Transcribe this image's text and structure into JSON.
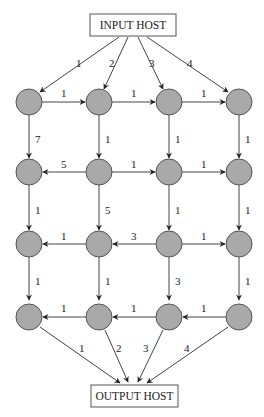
{
  "diagram": {
    "type": "directed weighted grid network",
    "input_host": {
      "label": "INPUT HOST"
    },
    "output_host": {
      "label": "OUTPUT HOST"
    },
    "grid": {
      "rows": 4,
      "cols": 4
    },
    "node_color": "#a9a9a9",
    "edges": {
      "input": [
        {
          "to": "r1c1",
          "weight": "1"
        },
        {
          "to": "r1c2",
          "weight": "2"
        },
        {
          "to": "r1c3",
          "weight": "3"
        },
        {
          "to": "r1c4",
          "weight": "4"
        }
      ],
      "row1": [
        {
          "from": "r1c1",
          "to": "r1c2",
          "weight": "1"
        },
        {
          "from": "r1c2",
          "to": "r1c3",
          "weight": "1"
        },
        {
          "from": "r1c3",
          "to": "r1c4",
          "weight": "1"
        }
      ],
      "down1": [
        {
          "from": "r1c1",
          "to": "r2c1",
          "weight": "7"
        },
        {
          "from": "r1c2",
          "to": "r2c2",
          "weight": "1"
        },
        {
          "from": "r1c3",
          "to": "r2c3",
          "weight": "1"
        },
        {
          "from": "r1c4",
          "to": "r2c4",
          "weight": "1"
        }
      ],
      "row2": [
        {
          "from": "r2c2",
          "to": "r2c1",
          "weight": "5"
        },
        {
          "from": "r2c2",
          "to": "r2c3",
          "weight": "1"
        },
        {
          "from": "r2c3",
          "to": "r2c4",
          "weight": "1"
        }
      ],
      "down2": [
        {
          "from": "r2c1",
          "to": "r3c1",
          "weight": "1"
        },
        {
          "from": "r2c2",
          "to": "r3c2",
          "weight": "5"
        },
        {
          "from": "r2c3",
          "to": "r3c3",
          "weight": "1"
        },
        {
          "from": "r2c4",
          "to": "r3c4",
          "weight": "1"
        }
      ],
      "row3": [
        {
          "from": "r3c2",
          "to": "r3c1",
          "weight": "1"
        },
        {
          "from": "r3c3",
          "to": "r3c2",
          "weight": "3"
        },
        {
          "from": "r3c3",
          "to": "r3c4",
          "weight": "1"
        }
      ],
      "down3": [
        {
          "from": "r3c1",
          "to": "r4c1",
          "weight": "1"
        },
        {
          "from": "r3c2",
          "to": "r4c2",
          "weight": "1"
        },
        {
          "from": "r3c3",
          "to": "r4c3",
          "weight": "3"
        },
        {
          "from": "r3c4",
          "to": "r4c4",
          "weight": "1"
        }
      ],
      "row4": [
        {
          "from": "r4c2",
          "to": "r4c1",
          "weight": "1"
        },
        {
          "from": "r4c3",
          "to": "r4c2",
          "weight": "1"
        },
        {
          "from": "r4c4",
          "to": "r4c3",
          "weight": "1"
        }
      ],
      "output": [
        {
          "from": "r4c1",
          "weight": "1"
        },
        {
          "from": "r4c2",
          "weight": "2"
        },
        {
          "from": "r4c3",
          "weight": "3"
        },
        {
          "from": "r4c4",
          "weight": "4"
        }
      ]
    }
  }
}
